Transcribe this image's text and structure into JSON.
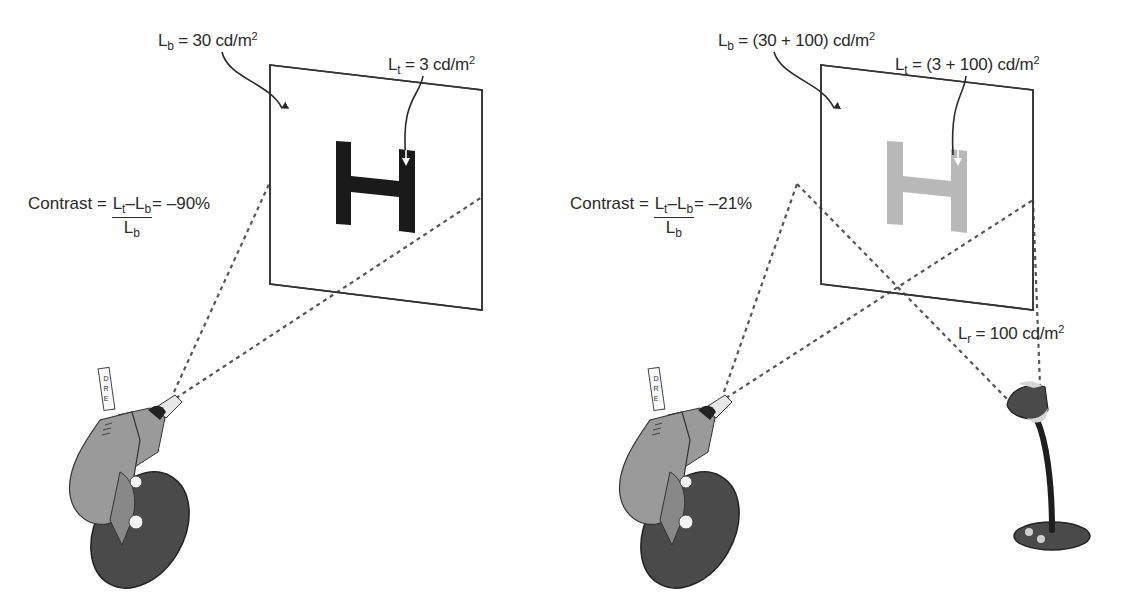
{
  "left_scenario": {
    "background_label": {
      "symbol": "L",
      "subscript": "b",
      "value": "= 30 cd/m",
      "superscript": "2"
    },
    "target_label": {
      "symbol": "L",
      "subscript": "t",
      "value": "= 3 cd/m",
      "superscript": "2"
    },
    "contrast": {
      "prefix": "Contrast =",
      "numerator": {
        "a": "L",
        "a_sub": "t",
        "op": "–",
        "b": "L",
        "b_sub": "b"
      },
      "denominator": {
        "sym": "L",
        "sub": "b"
      },
      "result": "= –90%"
    },
    "target_letter": "H",
    "target_color": "#1a1a1a",
    "meter_strip_letters": [
      "D",
      "R",
      "E"
    ]
  },
  "right_scenario": {
    "background_label": {
      "symbol": "L",
      "subscript": "b",
      "value": "= (30 + 100) cd/m",
      "superscript": "2"
    },
    "target_label": {
      "symbol": "L",
      "subscript": "t",
      "value": "= (3 + 100) cd/m",
      "superscript": "2"
    },
    "contrast": {
      "prefix": "Contrast =",
      "numerator": {
        "a": "L",
        "a_sub": "t",
        "op": "–",
        "b": "L",
        "b_sub": "b"
      },
      "denominator": {
        "sym": "L",
        "sub": "b"
      },
      "result": "= –21%"
    },
    "reflected_label": {
      "symbol": "L",
      "subscript": "r",
      "value": "= 100 cd/m",
      "superscript": "2"
    },
    "target_letter": "H",
    "target_color": "#b8b8b8",
    "meter_strip_letters": [
      "D",
      "R",
      "E"
    ]
  }
}
